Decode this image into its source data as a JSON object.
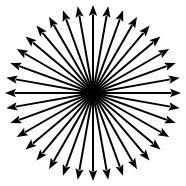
{
  "figure": {
    "type": "radial-arrow-diagram",
    "width": 186,
    "height": 186,
    "background_color": "#ffffff",
    "stroke_color": "#000000",
    "fill_color": "#000000"
  },
  "chart_data": {
    "type": "scatter",
    "subtitle": "",
    "xlabel": "",
    "ylabel": "",
    "grid": false,
    "legend": null,
    "axis_visible": false,
    "tick_labels": [],
    "annotations": [],
    "center": {
      "x": 93,
      "y": 93
    },
    "hub_radius": 8,
    "ray_count": 36,
    "angle_step_degrees": 10,
    "start_angle_degrees": 0,
    "inner_radius": 3,
    "outer_radius": 88,
    "line_width": 2.0,
    "arrowhead_length": 11,
    "arrowhead_half_width": 4.2,
    "angles_degrees": [
      0,
      10,
      20,
      30,
      40,
      50,
      60,
      70,
      80,
      90,
      100,
      110,
      120,
      130,
      140,
      150,
      160,
      170,
      180,
      190,
      200,
      210,
      220,
      230,
      240,
      250,
      260,
      270,
      280,
      290,
      300,
      310,
      320,
      330,
      340,
      350
    ],
    "tip_points": [
      {
        "angle": 0,
        "x": 181.0,
        "y": 93.0
      },
      {
        "angle": 10,
        "x": 179.7,
        "y": 77.7
      },
      {
        "angle": 20,
        "x": 175.7,
        "y": 62.9
      },
      {
        "angle": 30,
        "x": 169.2,
        "y": 49.0
      },
      {
        "angle": 40,
        "x": 160.4,
        "y": 36.4
      },
      {
        "angle": 50,
        "x": 149.6,
        "y": 25.6
      },
      {
        "angle": 60,
        "x": 137.0,
        "y": 16.8
      },
      {
        "angle": 70,
        "x": 123.1,
        "y": 10.3
      },
      {
        "angle": 80,
        "x": 108.3,
        "y": 6.3
      },
      {
        "angle": 90,
        "x": 93.0,
        "y": 5.0
      },
      {
        "angle": 100,
        "x": 77.7,
        "y": 6.3
      },
      {
        "angle": 110,
        "x": 62.9,
        "y": 10.3
      },
      {
        "angle": 120,
        "x": 49.0,
        "y": 16.8
      },
      {
        "angle": 130,
        "x": 36.4,
        "y": 25.6
      },
      {
        "angle": 140,
        "x": 25.6,
        "y": 36.4
      },
      {
        "angle": 150,
        "x": 16.8,
        "y": 49.0
      },
      {
        "angle": 160,
        "x": 10.3,
        "y": 62.9
      },
      {
        "angle": 170,
        "x": 6.3,
        "y": 77.7
      },
      {
        "angle": 180,
        "x": 5.0,
        "y": 93.0
      },
      {
        "angle": 190,
        "x": 6.3,
        "y": 108.3
      },
      {
        "angle": 200,
        "x": 10.3,
        "y": 123.1
      },
      {
        "angle": 210,
        "x": 16.8,
        "y": 137.0
      },
      {
        "angle": 220,
        "x": 25.6,
        "y": 149.6
      },
      {
        "angle": 230,
        "x": 36.4,
        "y": 160.4
      },
      {
        "angle": 240,
        "x": 49.0,
        "y": 169.2
      },
      {
        "angle": 250,
        "x": 62.9,
        "y": 175.7
      },
      {
        "angle": 260,
        "x": 77.7,
        "y": 179.7
      },
      {
        "angle": 270,
        "x": 93.0,
        "y": 181.0
      },
      {
        "angle": 280,
        "x": 108.3,
        "y": 179.7
      },
      {
        "angle": 290,
        "x": 123.1,
        "y": 175.7
      },
      {
        "angle": 300,
        "x": 137.0,
        "y": 169.2
      },
      {
        "angle": 310,
        "x": 149.6,
        "y": 160.4
      },
      {
        "angle": 320,
        "x": 160.4,
        "y": 149.6
      },
      {
        "angle": 330,
        "x": 169.2,
        "y": 137.0
      },
      {
        "angle": 340,
        "x": 175.7,
        "y": 123.1
      },
      {
        "angle": 350,
        "x": 179.7,
        "y": 108.3
      }
    ]
  }
}
